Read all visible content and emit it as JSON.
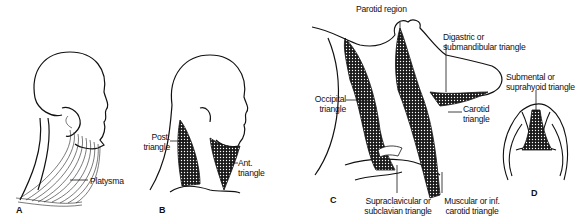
{
  "figure": {
    "panels": [
      {
        "id": "A",
        "label": "A",
        "annotations": [
          {
            "text": "Platysma"
          }
        ]
      },
      {
        "id": "B",
        "label": "B",
        "annotations": [
          {
            "text_line1": "Post.",
            "text_line2": "triangle"
          },
          {
            "text_line1": "Ant.",
            "text_line2": "triangle"
          }
        ]
      },
      {
        "id": "C",
        "label": "C",
        "annotations": [
          {
            "text": "Parotid region"
          },
          {
            "text_line1": "Digastric or",
            "text_line2": "submandibular triangle"
          },
          {
            "text_line1": "Occipital",
            "text_line2": "triangle"
          },
          {
            "text_line1": "Carotid",
            "text_line2": "triangle"
          },
          {
            "text_line1": "Supraclavicular or",
            "text_line2": "subclavian triangle"
          },
          {
            "text_line1": "Muscular or inf.",
            "text_line2": "carotid triangle"
          }
        ]
      },
      {
        "id": "D",
        "label": "D",
        "annotations": [
          {
            "text_line1": "Submental or",
            "text_line2": "suprahyoid triangle"
          }
        ]
      }
    ],
    "colors": {
      "line": "#111111",
      "shading": "#222222",
      "background": "#ffffff"
    }
  }
}
